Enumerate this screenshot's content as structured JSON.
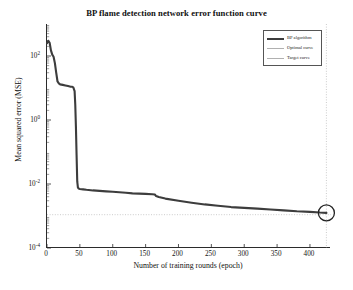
{
  "chart_data": {
    "type": "line",
    "title": "BP flame detection network error function curve",
    "xlabel": "Number of training rounds (epoch)",
    "ylabel": "Mean squared error (MSE)",
    "yscale": "log",
    "xlim": [
      0,
      432
    ],
    "ylim": [
      0.0001,
      1000
    ],
    "grid": false,
    "legend_position": "top-right",
    "xticks": [
      0,
      50,
      100,
      150,
      200,
      250,
      300,
      350,
      400
    ],
    "xtick_labels": [
      "0",
      "50",
      "100",
      "150",
      "200",
      "250",
      "300",
      "350",
      "400"
    ],
    "yticks": [
      100,
      1,
      0.01,
      0.0001
    ],
    "ytick_labels": [
      "10",
      "10",
      "10",
      "10"
    ],
    "ytick_exponents": [
      "2",
      "0",
      "-2",
      "-4"
    ],
    "series": [
      {
        "name": "BP algorithm",
        "color": "#3d3d3d",
        "linewidth": 2.1,
        "style": "solid",
        "x": [
          0,
          2,
          4,
          6,
          8,
          10,
          12,
          14,
          16,
          18,
          20,
          24,
          28,
          32,
          36,
          38,
          40,
          42,
          43,
          44,
          45,
          46,
          47,
          48,
          50,
          55,
          60,
          70,
          80,
          90,
          100,
          110,
          120,
          130,
          140,
          150,
          160,
          164,
          166,
          170,
          180,
          200,
          220,
          240,
          260,
          280,
          300,
          320,
          340,
          360,
          380,
          400,
          415,
          425
        ],
        "y": [
          250,
          300,
          260,
          150,
          110,
          95,
          60,
          30,
          16,
          14,
          13,
          12.5,
          12,
          11.5,
          11,
          11,
          10.5,
          8,
          3,
          0.6,
          0.08,
          0.012,
          0.0078,
          0.0072,
          0.007,
          0.0068,
          0.0066,
          0.0063,
          0.0061,
          0.0059,
          0.0057,
          0.0055,
          0.0053,
          0.0051,
          0.005,
          0.0049,
          0.0048,
          0.0047,
          0.0042,
          0.0039,
          0.0035,
          0.003,
          0.0026,
          0.0023,
          0.0021,
          0.0019,
          0.0018,
          0.0017,
          0.0016,
          0.0015,
          0.0014,
          0.00135,
          0.00128,
          0.00125
        ]
      },
      {
        "name": "Optimal curve",
        "color": "#b6b6b6",
        "linewidth": 0.7,
        "style": "dotted",
        "type": "vline",
        "x_value": 425
      },
      {
        "name": "Target curve",
        "color": "#b6b6b6",
        "linewidth": 0.7,
        "style": "dotted",
        "type": "hline",
        "y_value": 0.0011
      }
    ],
    "annotations": [
      {
        "name": "best-point-marker",
        "shape": "circle",
        "x": 425,
        "y": 0.00125,
        "radius_px": 8,
        "color": "#242424"
      }
    ],
    "legend": [
      {
        "label": "BP algorithm",
        "color": "#3d3d3d",
        "thick": true
      },
      {
        "label": "Optimal curve",
        "color": "#b0b0b0",
        "thick": false
      },
      {
        "label": "Target curve",
        "color": "#b0b0b0",
        "thick": false
      }
    ]
  },
  "caption": ""
}
